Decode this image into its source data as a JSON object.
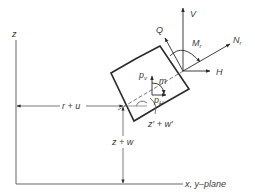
{
  "diagram": {
    "type": "shell-element-free-body",
    "colors": {
      "line": "#2a2a2a",
      "thin_line": "#555555",
      "text": "#3a3a3a",
      "background": "#ffffff"
    },
    "axes": {
      "z_label": "z",
      "plane_label": "x, y–plane"
    },
    "dimensions": {
      "radial": "r + u",
      "height": "z + w",
      "meridian": "z′ + w′"
    },
    "loads": {
      "p_v": "p",
      "p_v_sub": "v",
      "p_h": "p",
      "p_h_sub": "H",
      "m": "m"
    },
    "edge_forces": {
      "V": "V",
      "H": "H",
      "Q": "Q",
      "N": "N",
      "N_sub": "r",
      "M": "M",
      "M_sub": "r"
    }
  }
}
